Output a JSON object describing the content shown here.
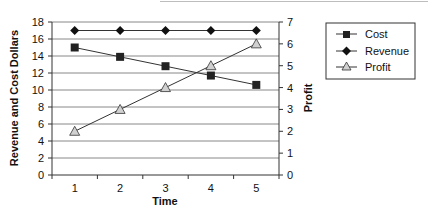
{
  "chart_data": {
    "type": "line",
    "title": "",
    "categories": [
      "1",
      "2",
      "3",
      "4",
      "5"
    ],
    "xlabel": "Time",
    "ylabel": "Revenue and Cost Dollars",
    "y2label": "Profit",
    "ylim": [
      0,
      18
    ],
    "y2lim": [
      0,
      7
    ],
    "yticks": [
      "0",
      "2",
      "4",
      "6",
      "8",
      "10",
      "12",
      "14",
      "16",
      "18"
    ],
    "y2ticks": [
      "0",
      "1",
      "2",
      "3",
      "4",
      "5",
      "6",
      "7"
    ],
    "grid": true,
    "legend_position": "right",
    "series": [
      {
        "name": "Cost",
        "axis": "left",
        "marker": "square",
        "values": [
          15,
          13.9,
          12.8,
          11.7,
          10.6
        ]
      },
      {
        "name": "Revenue",
        "axis": "left",
        "marker": "diamond",
        "values": [
          17,
          17,
          17,
          17,
          17
        ]
      },
      {
        "name": "Profit",
        "axis": "right",
        "marker": "triangle",
        "values": [
          2,
          3,
          4,
          5,
          6
        ]
      }
    ]
  },
  "legend": {
    "items": [
      {
        "label": "Cost"
      },
      {
        "label": "Revenue"
      },
      {
        "label": "Profit"
      }
    ]
  },
  "colors": {
    "line": "#333333",
    "marker_fill": "#222222",
    "triangle_fill": "#d0d0d0",
    "grid": "#888888"
  }
}
